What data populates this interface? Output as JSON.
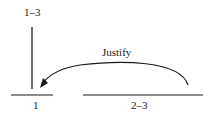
{
  "diagram": {
    "labels": {
      "top": "1–3",
      "arrow": "Justify",
      "left_base": "1",
      "right_base": "2–3"
    },
    "colors": {
      "stroke": "#1a1a1a",
      "background": "#ffffff"
    }
  }
}
